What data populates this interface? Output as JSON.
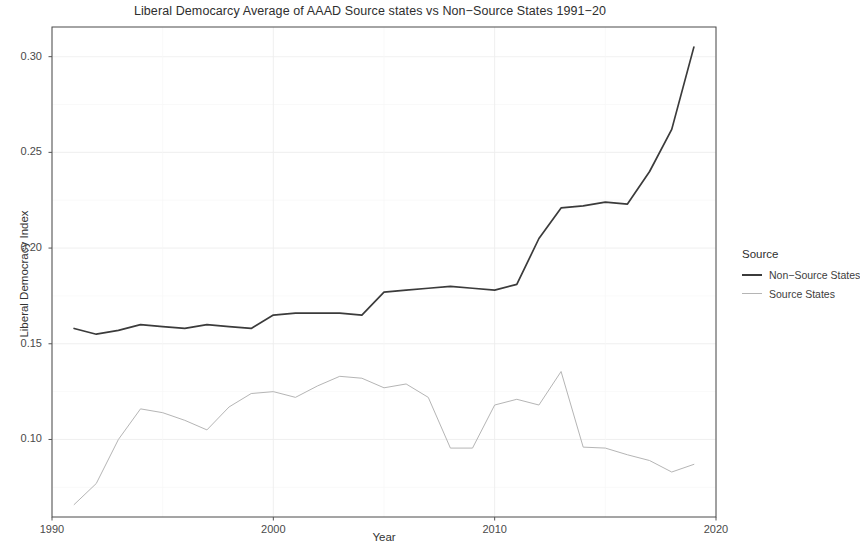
{
  "chart_data": {
    "type": "line",
    "title": "Liberal Democarcy Average of AAAD Source states vs Non−Source States 1991−20",
    "xlabel": "Year",
    "ylabel": "Liberal Democracy Index",
    "xlim": [
      1990,
      2020
    ],
    "ylim": [
      0.06,
      0.315
    ],
    "xticks": [
      1990,
      2000,
      2010,
      2020
    ],
    "xtick_labels": [
      "1990",
      "2000",
      "2010",
      "2020"
    ],
    "yticks": [
      0.1,
      0.15,
      0.2,
      0.25,
      0.3
    ],
    "ytick_labels": [
      "0.10",
      "0.15",
      "0.20",
      "0.25",
      "0.30"
    ],
    "grid": true,
    "legend_position": "right",
    "legend_title": "Source",
    "x": [
      1991,
      1992,
      1993,
      1994,
      1995,
      1996,
      1997,
      1998,
      1999,
      2000,
      2001,
      2002,
      2003,
      2004,
      2005,
      2006,
      2007,
      2008,
      2009,
      2010,
      2011,
      2012,
      2013,
      2014,
      2015,
      2016,
      2017,
      2018,
      2019
    ],
    "series": [
      {
        "name": "Non−Source States",
        "color": "#3b3b3b",
        "values": [
          0.158,
          0.155,
          0.157,
          0.16,
          0.159,
          0.158,
          0.16,
          0.159,
          0.158,
          0.165,
          0.166,
          0.166,
          0.166,
          0.165,
          0.177,
          0.178,
          0.179,
          0.18,
          0.179,
          0.178,
          0.181,
          0.205,
          0.221,
          0.222,
          0.224,
          0.223,
          0.24,
          0.262,
          0.305
        ]
      },
      {
        "name": "Source States",
        "color": "#b5b5b5",
        "values": [
          0.066,
          0.077,
          0.1,
          0.116,
          0.114,
          0.11,
          0.105,
          0.117,
          0.124,
          0.125,
          0.122,
          0.128,
          0.133,
          0.132,
          0.127,
          0.129,
          0.122,
          0.096,
          0.096,
          0.096,
          0.121,
          0.119,
          0.117,
          0.118,
          0.121,
          0.128,
          0.136,
          0.096,
          0.092
        ]
      }
    ],
    "series_overrides": {
      "note_source_states_actual": [
        0.066,
        0.077,
        0.1,
        0.116,
        0.114,
        0.11,
        0.105,
        0.117,
        0.124,
        0.125,
        0.122,
        0.128,
        0.133,
        0.132,
        0.127,
        0.129,
        0.122,
        0.0955,
        0.0955,
        0.118,
        0.121,
        0.118,
        0.1355,
        0.096,
        0.0955,
        0.092,
        0.089,
        0.083,
        0.087
      ]
    }
  }
}
